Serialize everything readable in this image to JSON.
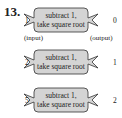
{
  "problem_number": "13.",
  "labels": {
    "input": "(input)",
    "output": "(output)"
  },
  "machines": [
    {
      "line1": "subtract 1,",
      "line2": "take square root",
      "input": "1",
      "output": "0"
    },
    {
      "line1": "subtract 1,",
      "line2": "take square root",
      "input": "2",
      "output": "1"
    },
    {
      "line1": "subtract 1,",
      "line2": "take square root",
      "input": "5",
      "output": "2"
    }
  ],
  "colors": {
    "box_fill": "#d4d4d4",
    "box_stroke": "#333333"
  }
}
